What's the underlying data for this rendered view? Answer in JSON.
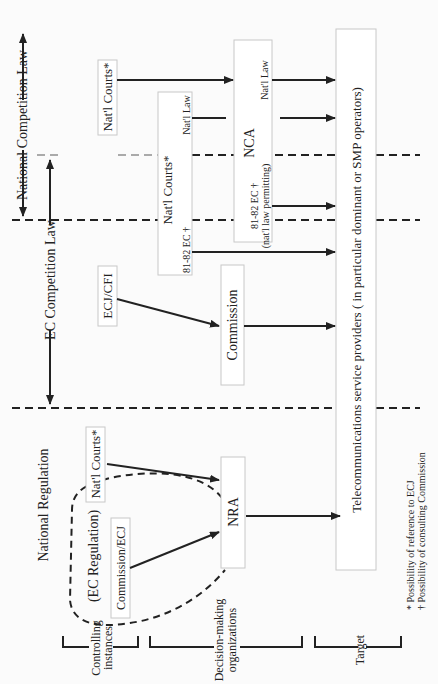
{
  "diagram": {
    "orientation": "rotated-90-ccw",
    "columns": {
      "national_competition_law": "National Competition Law",
      "ec_competition_law": "EC Competition Law",
      "national_regulation": "National Regulation",
      "ec_regulation": "(EC Regulation)"
    },
    "nodes": {
      "natl_courts_top": "Nat'l Courts*",
      "natl_courts_mid": "Nat'l Courts*",
      "natl_courts_mid_law": "Nat'l Law",
      "natl_courts_mid_ec": "81-82 EC †",
      "nca": "NCA",
      "nca_law": "Nat'l Law",
      "nca_ec": "81-82 EC †",
      "nca_ec_note": "(nat'l law permitting)",
      "ecj_cfi": "ECJ/CFI",
      "commission": "Commission",
      "natl_courts_reg": "Nat'l Courts*",
      "commission_ecj": "Commission/ECJ",
      "nra": "NRA",
      "target": "Telecommunications service providers ( in particular dominant or SMP operators)"
    },
    "rows": {
      "controlling": [
        "Controlling",
        "instances"
      ],
      "decision": [
        "Decision-making",
        "organizations"
      ],
      "target": "Target"
    },
    "footnotes": {
      "star": "* Possibility of reference to ECJ",
      "dagger": "† Possibility of consulting Commission"
    },
    "edges": [
      {
        "from": "natl_courts_top",
        "to": "nca",
        "style": "solid"
      },
      {
        "from": "natl_courts_mid",
        "to": "nca",
        "label": "Nat'l Law",
        "style": "solid"
      },
      {
        "from": "natl_courts_mid",
        "to": "target",
        "label": "81-82 EC †",
        "style": "solid"
      },
      {
        "from": "nca",
        "to": "target",
        "label": "Nat'l Law",
        "style": "solid"
      },
      {
        "from": "nca",
        "to": "target",
        "label": "81-82 EC †",
        "style": "solid"
      },
      {
        "from": "ecj_cfi",
        "to": "commission",
        "style": "solid"
      },
      {
        "from": "commission",
        "to": "target",
        "style": "solid"
      },
      {
        "from": "natl_courts_reg",
        "to": "nra",
        "style": "solid"
      },
      {
        "from": "commission_ecj",
        "to": "nra",
        "style": "solid"
      },
      {
        "from": "nra",
        "to": "target",
        "style": "solid"
      }
    ]
  }
}
